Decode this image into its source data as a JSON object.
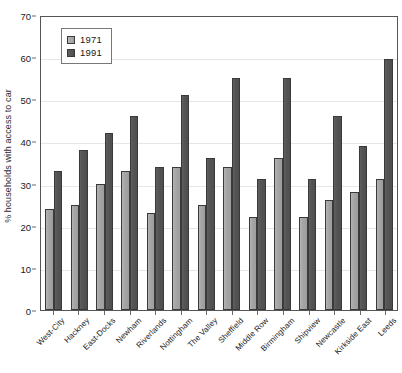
{
  "chart_data": {
    "type": "bar",
    "title": "",
    "subtitle": "",
    "xlabel": "",
    "ylabel": "% households with access to car",
    "ylim": [
      0,
      70
    ],
    "ytick_step": 10,
    "yticks": [
      0,
      10,
      20,
      30,
      40,
      50,
      60,
      70
    ],
    "grid": true,
    "grid_axis": "y",
    "legend_position": "top-left",
    "categories": [
      "West-City",
      "Hackney",
      "East-Docks",
      "Newham",
      "Riverlands",
      "Nottingham",
      "The Valley",
      "Sheffield",
      "Middle Row",
      "Birmingham",
      "Shipview",
      "Newcastle",
      "Kirkside East",
      "Leeds"
    ],
    "series": [
      {
        "name": "1971",
        "color": "#a6a6a6",
        "values": [
          24,
          25,
          30,
          33,
          23,
          34,
          25,
          34,
          22,
          36,
          22,
          26,
          28,
          31
        ]
      },
      {
        "name": "1991",
        "color": "#555555",
        "values": [
          33,
          38,
          42,
          46,
          34,
          51,
          36,
          55,
          31,
          55,
          31,
          46,
          39,
          59.5
        ]
      }
    ]
  },
  "legend": {
    "entries": [
      {
        "label": "1971"
      },
      {
        "label": "1991"
      }
    ]
  },
  "colors": {
    "series_1971": "#a6a6a6",
    "series_1991": "#555555",
    "axis": "#555555",
    "gridline": "#e6e6e6",
    "text": "#1a1a1a",
    "background": "#ffffff"
  }
}
